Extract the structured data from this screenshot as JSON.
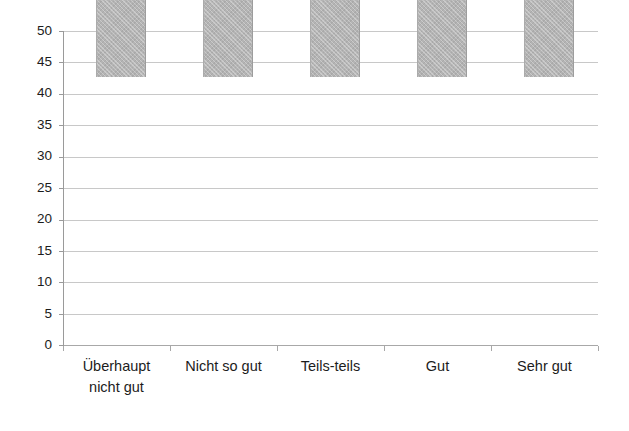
{
  "chart_data": {
    "type": "bar",
    "title": "",
    "subtitle": "",
    "xlabel": "",
    "ylabel": "",
    "categories": [
      "Überhaupt\nnicht gut",
      "Nicht so gut",
      "Teils-teils",
      "Gut",
      "Sehr gut"
    ],
    "category_labels_flat": [
      "Überhaupt nicht gut",
      "Nicht so gut",
      "Teils-teils",
      "Gut",
      "Sehr gut"
    ],
    "values": [
      2.0,
      7.3,
      27.3,
      44.4,
      19.7
    ],
    "series": [
      {
        "name": "",
        "values": [
          2.0,
          7.3,
          27.3,
          44.4,
          19.7
        ]
      }
    ],
    "ylim": [
      0,
      50
    ],
    "xlim": [
      0,
      5
    ],
    "yticks": [
      0,
      5,
      10,
      15,
      20,
      25,
      30,
      35,
      40,
      45,
      50
    ],
    "ytick_labels": [
      "0",
      "5",
      "10",
      "15",
      "20",
      "25",
      "30",
      "35",
      "40",
      "45",
      "50"
    ],
    "grid": "horizontal",
    "legend": "none",
    "legend_position": "none",
    "bar_color": "#b4b4b4",
    "grid_color": "#c8c8c8",
    "axis_color": "#9a9a9a",
    "text_color": "#1c1c1c",
    "background_color": "#ffffff",
    "annotations": []
  }
}
